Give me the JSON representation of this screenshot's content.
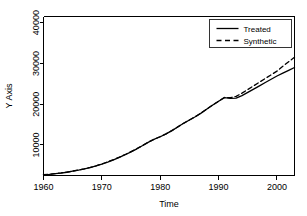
{
  "chart_data": {
    "type": "line",
    "title": "",
    "xlabel": "Time",
    "ylabel": "Y Axis",
    "xlim": [
      1960,
      2003
    ],
    "ylim": [
      2500,
      41500
    ],
    "grid": false,
    "legend_position": "top-right",
    "xticks": [
      1960,
      1970,
      1980,
      1990,
      2000
    ],
    "xtick_labels": [
      "1960",
      "1970",
      "1980",
      "1990",
      "2000"
    ],
    "yticks": [
      10000,
      20000,
      30000,
      40000
    ],
    "ytick_labels": [
      "10000",
      "20000",
      "30000",
      "40000"
    ],
    "x": [
      1960,
      1961,
      1962,
      1963,
      1964,
      1965,
      1966,
      1967,
      1968,
      1969,
      1970,
      1971,
      1972,
      1973,
      1974,
      1975,
      1976,
      1977,
      1978,
      1979,
      1980,
      1981,
      1982,
      1983,
      1984,
      1985,
      1986,
      1987,
      1988,
      1989,
      1990,
      1991,
      1992,
      1993,
      1994,
      1995,
      1996,
      1997,
      1998,
      1999,
      2000,
      2001,
      2002,
      2003
    ],
    "series": [
      {
        "name": "Treated",
        "style": "solid",
        "color": "#000000",
        "values": [
          2700,
          2800,
          2950,
          3100,
          3300,
          3550,
          3800,
          4100,
          4450,
          4850,
          5300,
          5800,
          6350,
          6950,
          7600,
          8300,
          9050,
          9850,
          10700,
          11400,
          12000,
          12700,
          13500,
          14400,
          15300,
          16100,
          16900,
          17800,
          18800,
          19800,
          20700,
          21600,
          21400,
          21500,
          22100,
          22900,
          23700,
          24500,
          25300,
          26100,
          26900,
          27600,
          28300,
          29000
        ]
      },
      {
        "name": "Synthetic",
        "style": "dashed",
        "color": "#000000",
        "values": [
          2700,
          2820,
          2970,
          3130,
          3330,
          3580,
          3830,
          4130,
          4480,
          4880,
          5340,
          5850,
          6400,
          7000,
          7650,
          8350,
          9080,
          9880,
          10720,
          11420,
          12020,
          12720,
          13520,
          14420,
          15320,
          16120,
          16920,
          17820,
          18820,
          19820,
          20720,
          21650,
          21600,
          21900,
          22700,
          23600,
          24500,
          25400,
          26300,
          27200,
          28100,
          29300,
          30400,
          31500
        ]
      }
    ],
    "legend": [
      {
        "label": "Treated",
        "style": "solid"
      },
      {
        "label": "Synthetic",
        "style": "dashed"
      }
    ]
  }
}
